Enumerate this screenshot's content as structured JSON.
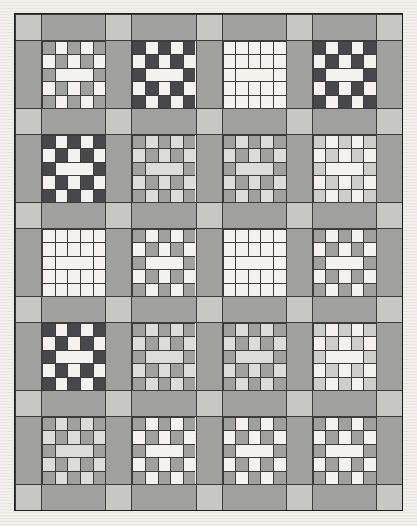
{
  "page": {
    "background_color": "#f2f0ea",
    "background_stripe_color": "#e8e6e0"
  },
  "palette": {
    "dark": "#47474c",
    "medium": "#a0a09f",
    "light": "#cdcdca",
    "white": "#f3f2ee",
    "pale": "#dcdcd8",
    "sashing": "#a0a09f",
    "cornerstone": "#c7c7c3",
    "seam": "#3c3c3c",
    "outline": "#1c1c1c"
  },
  "quilt": {
    "columns": 4,
    "rows": 5,
    "block_grid": 5,
    "pattern": [
      [
        "C",
        "B",
        "C",
        "B",
        "C"
      ],
      [
        "B",
        "C",
        "B",
        "C",
        "B"
      ],
      [
        "C",
        "BAR",
        "C"
      ],
      [
        "B",
        "C",
        "B",
        "C",
        "B"
      ],
      [
        "C",
        "B",
        "C",
        "B",
        "C"
      ]
    ],
    "blocks": [
      [
        {
          "name": "block-r1c1",
          "chain": "medium",
          "bg": "white"
        },
        {
          "name": "block-r1c2",
          "chain": "dark",
          "bg": "white"
        },
        {
          "name": "block-r1c3",
          "chain": "white",
          "bg": "white"
        },
        {
          "name": "block-r1c4",
          "chain": "dark",
          "bg": "white"
        }
      ],
      [
        {
          "name": "block-r2c1",
          "chain": "dark",
          "bg": "white"
        },
        {
          "name": "block-r2c2",
          "chain": "medium",
          "bg": "pale"
        },
        {
          "name": "block-r2c3",
          "chain": "medium",
          "bg": "pale"
        },
        {
          "name": "block-r2c4",
          "chain": "light",
          "bg": "white"
        }
      ],
      [
        {
          "name": "block-r3c1",
          "chain": "white",
          "bg": "white"
        },
        {
          "name": "block-r3c2",
          "chain": "medium",
          "bg": "white"
        },
        {
          "name": "block-r3c3",
          "chain": "white",
          "bg": "white"
        },
        {
          "name": "block-r3c4",
          "chain": "medium",
          "bg": "white"
        }
      ],
      [
        {
          "name": "block-r4c1",
          "chain": "dark",
          "bg": "white"
        },
        {
          "name": "block-r4c2",
          "chain": "medium",
          "bg": "pale"
        },
        {
          "name": "block-r4c3",
          "chain": "medium",
          "bg": "pale"
        },
        {
          "name": "block-r4c4",
          "chain": "light",
          "bg": "white"
        }
      ],
      [
        {
          "name": "block-r5c1",
          "chain": "medium",
          "bg": "pale"
        },
        {
          "name": "block-r5c2",
          "chain": "medium",
          "bg": "white"
        },
        {
          "name": "block-r5c3",
          "chain": "medium",
          "bg": "white"
        },
        {
          "name": "block-r5c4",
          "chain": "medium",
          "bg": "white"
        }
      ]
    ]
  }
}
